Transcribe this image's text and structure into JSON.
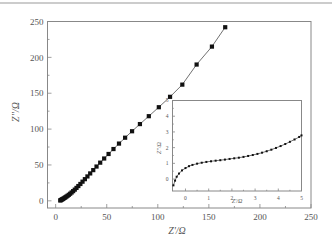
{
  "chart_data": [
    {
      "id": "main",
      "type": "scatter",
      "title": "",
      "xlabel": "Z'/Ω",
      "ylabel": "Z''/Ω",
      "xlim": [
        -8,
        250
      ],
      "ylim": [
        -10,
        250
      ],
      "xticks": [
        0,
        50,
        100,
        150,
        200,
        250
      ],
      "yticks": [
        0,
        50,
        100,
        150,
        200,
        250
      ],
      "grid": false,
      "legend": null,
      "marker": "square",
      "line": true,
      "series": [
        {
          "name": "impedance",
          "x": [
            4.5,
            5.0,
            5.6,
            6.3,
            7.0,
            7.8,
            8.7,
            9.6,
            10.6,
            11.7,
            12.9,
            14.2,
            15.6,
            17.1,
            18.7,
            20.4,
            22.2,
            24.2,
            26.3,
            28.6,
            31.1,
            33.8,
            36.8,
            40.0,
            43.6,
            47.5,
            51.8,
            56.6,
            62.0,
            68.0,
            74.8,
            82.5,
            91.2,
            101.0,
            112.0,
            124.0,
            138.0,
            153.0,
            166.0
          ],
          "y": [
            0.5,
            1.0,
            1.5,
            2.0,
            2.6,
            3.3,
            4.1,
            5.0,
            6.0,
            7.1,
            8.4,
            9.9,
            11.6,
            13.5,
            15.6,
            18.0,
            20.6,
            23.5,
            26.7,
            30.2,
            34.0,
            38.2,
            42.8,
            47.8,
            53.2,
            59.0,
            65.3,
            72.2,
            79.8,
            88.0,
            97.0,
            107.0,
            118.0,
            130.5,
            145.0,
            162.0,
            190.0,
            215.0,
            242.0
          ]
        }
      ]
    },
    {
      "id": "inset",
      "type": "scatter",
      "title": "",
      "xlabel": "Z'/Ω",
      "ylabel": "Z''/Ω",
      "xlim": [
        -0.56,
        5
      ],
      "ylim": [
        -0.76,
        5
      ],
      "xticks": [
        0,
        1,
        2,
        3,
        4,
        5
      ],
      "yticks": [
        0,
        1,
        2,
        3,
        4,
        5
      ],
      "grid": false,
      "legend": null,
      "marker": "small-square",
      "line": true,
      "series": [
        {
          "name": "impedance-zoom",
          "x": [
            -0.52,
            -0.45,
            -0.38,
            -0.28,
            -0.15,
            0.0,
            0.15,
            0.3,
            0.5,
            0.7,
            0.9,
            1.1,
            1.3,
            1.5,
            1.7,
            1.9,
            2.1,
            2.3,
            2.5,
            2.7,
            2.9,
            3.1,
            3.3,
            3.5,
            3.7,
            3.9,
            4.1,
            4.3,
            4.5,
            4.7,
            4.9,
            5.0
          ],
          "y": [
            -0.4,
            -0.1,
            0.15,
            0.35,
            0.55,
            0.7,
            0.82,
            0.9,
            0.98,
            1.04,
            1.09,
            1.13,
            1.17,
            1.2,
            1.24,
            1.28,
            1.32,
            1.36,
            1.41,
            1.47,
            1.53,
            1.6,
            1.68,
            1.77,
            1.87,
            1.98,
            2.1,
            2.23,
            2.37,
            2.52,
            2.68,
            2.78
          ]
        }
      ]
    }
  ],
  "main_axes": {
    "xlabel": "Z'/Ω",
    "ylabel": "Z''/Ω",
    "xtick_labels": [
      "0",
      "50",
      "100",
      "150",
      "200",
      "250"
    ],
    "ytick_labels": [
      "0",
      "50",
      "100",
      "150",
      "200",
      "250"
    ]
  },
  "inset_axes": {
    "xlabel": "Z'/Ω",
    "ylabel": "Z''/Ω",
    "xtick_labels": [
      "0",
      "1",
      "2",
      "3",
      "4",
      "5"
    ],
    "ytick_labels": [
      "0",
      "1",
      "2",
      "3",
      "4",
      "5"
    ]
  },
  "colors": {
    "frame": "#888888",
    "marker": "#111111",
    "line": "#333333",
    "text": "#555555"
  }
}
